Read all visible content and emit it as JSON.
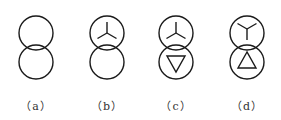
{
  "diagram": {
    "title": "",
    "stroke_color": "#1a1a1a",
    "symbols": [
      {
        "id": "a",
        "label": "（a）",
        "top": "none",
        "bottom": "none",
        "cx": 36
      },
      {
        "id": "b",
        "label": "（b）",
        "top": "star-Y",
        "bottom": "none",
        "cx": 107
      },
      {
        "id": "c",
        "label": "（c）",
        "top": "star-Y",
        "bottom": "delta-down",
        "cx": 176
      },
      {
        "id": "d",
        "label": "（d）",
        "top": "star-Y-inverted",
        "bottom": "delta-up",
        "cx": 247
      }
    ]
  }
}
